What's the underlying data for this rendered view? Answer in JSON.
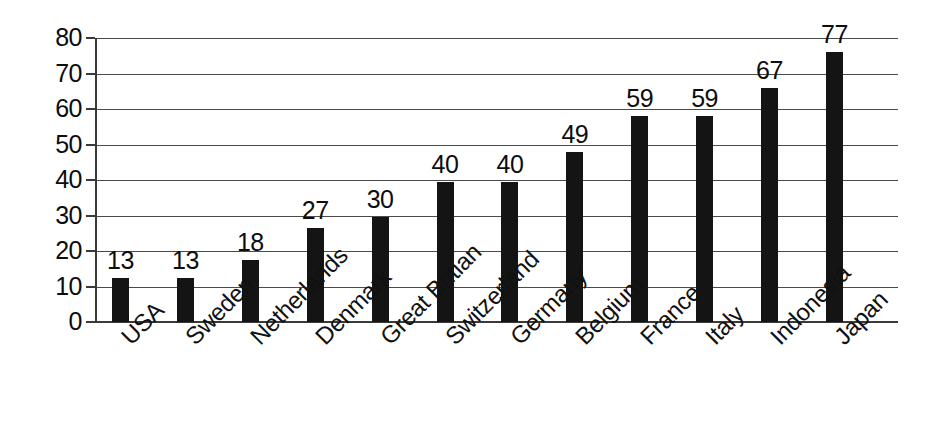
{
  "chart_data": {
    "type": "bar",
    "title": "",
    "subtitle": "",
    "xlabel": "",
    "ylabel": "",
    "orientation": "vertical",
    "grid": true,
    "legend": false,
    "legend_position": "none",
    "bar_color": "#141414",
    "gridline_color": "#4a4a4a",
    "axis_color": "#3a3a3a",
    "background_color": "#ffffff",
    "ylim": [
      0,
      80
    ],
    "ytick_step": 10,
    "ytick_labels": [
      "0",
      "10",
      "20",
      "30",
      "40",
      "50",
      "60",
      "70",
      "80"
    ],
    "ytick_values": [
      0,
      10,
      20,
      30,
      40,
      50,
      60,
      70,
      80
    ],
    "categories": [
      "USA",
      "Sweden",
      "Netherlands",
      "Denmark",
      "Great Britian",
      "Switzerland",
      "Germany",
      "Belgium",
      "France",
      "Italy",
      "Indonesia",
      "Japan"
    ],
    "values": [
      13,
      13,
      18,
      27,
      30,
      40,
      40,
      49,
      59,
      59,
      67,
      77
    ],
    "bar_heights_drawn": [
      12.5,
      12.5,
      17.5,
      26.5,
      29.5,
      39.5,
      39.5,
      48,
      58,
      58,
      66,
      76
    ],
    "data_labels": [
      "13",
      "13",
      "18",
      "27",
      "30",
      "40",
      "40",
      "49",
      "59",
      "59",
      "67",
      "77"
    ],
    "series": [
      {
        "name": "",
        "values": [
          13,
          13,
          18,
          27,
          30,
          40,
          40,
          49,
          59,
          59,
          67,
          77
        ]
      }
    ]
  }
}
